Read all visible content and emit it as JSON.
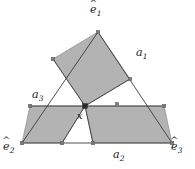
{
  "figure": {
    "type": "geometry-diagram",
    "width": 195,
    "height": 169,
    "background_color": "#ffffff",
    "stroke_color": "#3a3a3a",
    "shade_color": "#b3b3b3",
    "shade_edge_color": "#8a8a8a",
    "marker_color": "#6e6e6e",
    "point_color": "#2b2b2b"
  },
  "labels": {
    "apex": {
      "base": "e",
      "sub": "1",
      "hat": "ˆ",
      "text": "ê₁",
      "x": 90,
      "y": 4
    },
    "bottom_left": {
      "base": "e",
      "sub": "2",
      "hat": "ˆ",
      "text": "ê₂",
      "x": 4,
      "y": 142
    },
    "bottom_right": {
      "base": "e",
      "sub": "3",
      "hat": "ˆ",
      "text": "ê₃",
      "x": 172,
      "y": 142
    },
    "area_1": {
      "base": "a",
      "sub": "1",
      "text": "a₁",
      "x": 136,
      "y": 48
    },
    "area_2": {
      "base": "a",
      "sub": "2",
      "text": "a₂",
      "x": 113,
      "y": 150
    },
    "area_3": {
      "base": "a",
      "sub": "3",
      "text": "a₃",
      "x": 33,
      "y": 90
    },
    "point_x": {
      "base": "x",
      "text": "x",
      "x": 78,
      "y": 112
    }
  },
  "geometry": {
    "triangle": {
      "apex": [
        98,
        32
      ],
      "bottom_left": [
        22,
        143
      ],
      "bottom_right": [
        172,
        143
      ]
    },
    "interior_point": [
      85,
      106
    ],
    "horizontal_line": {
      "x1": 30,
      "y1": 106,
      "x2": 164,
      "y2": 106
    },
    "shaded_regions": [
      {
        "name": "upper-rhombus",
        "points": "98,32 130,79 85,106 53,59"
      },
      {
        "name": "lower-left-parallelogram",
        "points": "30,106 85,106 62,143 22,143"
      },
      {
        "name": "lower-right-parallelogram",
        "points": "85,106 164,106 172,143 93,143"
      }
    ],
    "square_markers": [
      [
        98,
        32
      ],
      [
        53,
        59
      ],
      [
        130,
        79
      ],
      [
        30,
        106
      ],
      [
        164,
        106
      ],
      [
        22,
        143
      ],
      [
        62,
        143
      ],
      [
        93,
        143
      ],
      [
        172,
        143
      ],
      [
        117,
        104
      ]
    ],
    "round_point": [
      85,
      106
    ]
  }
}
